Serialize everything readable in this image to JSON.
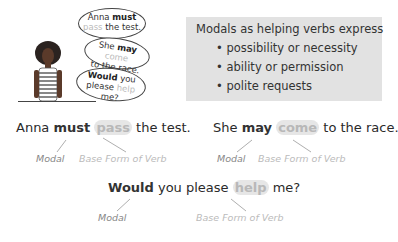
{
  "illustration": {
    "bubbles": [
      {
        "line1_pre": "Anna ",
        "line1_bold": "must",
        "line2_light": "pass",
        "line2_rest": " the test."
      },
      {
        "line1_pre": "She ",
        "line1_bold": "may",
        "line1_light": " come",
        "line2_rest": "to the race."
      },
      {
        "line1_bold": "Would",
        "line1_rest": " you",
        "line2_pre": "please ",
        "line2_light": "help",
        "line2_rest": " me?"
      }
    ]
  },
  "info_box": {
    "title": "Modals as helping verbs express",
    "bullets": [
      "• possibility or necessity",
      "• ability or permission",
      "• polite requests"
    ]
  },
  "examples": [
    {
      "pre": "Anna ",
      "modal": "must",
      "verb": "pass",
      "post": " the test.",
      "modal_label": "Modal",
      "verb_label": "Base Form of Verb"
    },
    {
      "pre": "She ",
      "modal": "may",
      "verb": "come",
      "post": " to the race.",
      "modal_label": "Modal",
      "verb_label": "Base Form of Verb"
    },
    {
      "pre": "",
      "modal": "Would",
      "mid": " you please ",
      "verb": "help",
      "post": " me?",
      "modal_label": "Modal",
      "verb_label": "Base Form of Verb"
    }
  ]
}
